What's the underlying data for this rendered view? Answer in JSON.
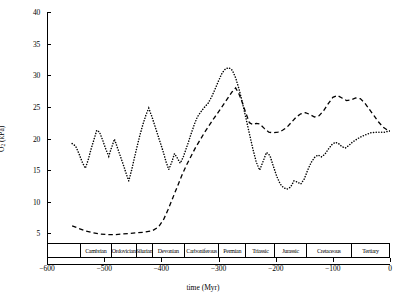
{
  "chart_data": {
    "type": "line",
    "title": "",
    "xlabel": "time (Myr)",
    "ylabel": "O2 (kPa)",
    "ylabel_parts": {
      "base": "O",
      "sub": "2",
      "unit": " (kPa)"
    },
    "xlim": [
      -600,
      0
    ],
    "ylim": [
      0,
      40
    ],
    "xticks": [
      -600,
      -500,
      -400,
      -300,
      -200,
      -100,
      0
    ],
    "xtick_labels": [
      "−600",
      "−500",
      "−400",
      "−300",
      "−200",
      "−100",
      "0"
    ],
    "yticks": [
      5,
      10,
      15,
      20,
      25,
      30,
      35,
      40
    ],
    "ytick_labels": [
      "5",
      "10",
      "15",
      "20",
      "25",
      "30",
      "35",
      "40"
    ],
    "grid": false,
    "legend": "none",
    "series": [
      {
        "name": "dotted-curve",
        "style": "dotted",
        "color": "#000000",
        "points": [
          [
            -556,
            19.2
          ],
          [
            -550,
            18.8
          ],
          [
            -544,
            17.6
          ],
          [
            -538,
            16.2
          ],
          [
            -533,
            15.3
          ],
          [
            -528,
            16.6
          ],
          [
            -523,
            18.3
          ],
          [
            -518,
            19.8
          ],
          [
            -513,
            21.3
          ],
          [
            -508,
            21.0
          ],
          [
            -502,
            19.6
          ],
          [
            -497,
            18.3
          ],
          [
            -492,
            17.2
          ],
          [
            -487,
            18.6
          ],
          [
            -482,
            19.9
          ],
          [
            -477,
            18.6
          ],
          [
            -472,
            17.3
          ],
          [
            -467,
            16.0
          ],
          [
            -462,
            14.6
          ],
          [
            -457,
            13.3
          ],
          [
            -452,
            15.0
          ],
          [
            -447,
            17.0
          ],
          [
            -442,
            18.9
          ],
          [
            -437,
            20.7
          ],
          [
            -432,
            22.3
          ],
          [
            -427,
            23.7
          ],
          [
            -422,
            24.8
          ],
          [
            -417,
            23.6
          ],
          [
            -412,
            22.2
          ],
          [
            -407,
            20.8
          ],
          [
            -402,
            19.4
          ],
          [
            -397,
            18.0
          ],
          [
            -392,
            16.4
          ],
          [
            -387,
            15.1
          ],
          [
            -382,
            16.2
          ],
          [
            -377,
            17.6
          ],
          [
            -372,
            16.9
          ],
          [
            -367,
            16.1
          ],
          [
            -362,
            17.0
          ],
          [
            -357,
            18.3
          ],
          [
            -352,
            19.6
          ],
          [
            -347,
            21.0
          ],
          [
            -342,
            22.3
          ],
          [
            -337,
            23.4
          ],
          [
            -331,
            24.2
          ],
          [
            -325,
            24.9
          ],
          [
            -318,
            25.6
          ],
          [
            -312,
            26.6
          ],
          [
            -306,
            27.8
          ],
          [
            -300,
            29.1
          ],
          [
            -294,
            30.3
          ],
          [
            -288,
            31.0
          ],
          [
            -282,
            31.2
          ],
          [
            -276,
            30.8
          ],
          [
            -270,
            29.6
          ],
          [
            -264,
            27.8
          ],
          [
            -258,
            25.6
          ],
          [
            -252,
            23.2
          ],
          [
            -246,
            20.8
          ],
          [
            -240,
            18.4
          ],
          [
            -234,
            16.3
          ],
          [
            -228,
            15.0
          ],
          [
            -222,
            16.4
          ],
          [
            -216,
            17.8
          ],
          [
            -210,
            17.3
          ],
          [
            -204,
            15.6
          ],
          [
            -198,
            14.0
          ],
          [
            -192,
            12.8
          ],
          [
            -186,
            12.2
          ],
          [
            -180,
            12.0
          ],
          [
            -174,
            12.3
          ],
          [
            -168,
            13.3
          ],
          [
            -162,
            13.1
          ],
          [
            -156,
            12.8
          ],
          [
            -150,
            13.6
          ],
          [
            -144,
            15.0
          ],
          [
            -138,
            16.2
          ],
          [
            -132,
            17.0
          ],
          [
            -126,
            17.4
          ],
          [
            -120,
            17.1
          ],
          [
            -114,
            17.5
          ],
          [
            -108,
            18.3
          ],
          [
            -102,
            19.0
          ],
          [
            -96,
            19.4
          ],
          [
            -90,
            19.2
          ],
          [
            -84,
            18.7
          ],
          [
            -78,
            18.5
          ],
          [
            -72,
            18.9
          ],
          [
            -66,
            19.4
          ],
          [
            -58,
            19.9
          ],
          [
            -50,
            20.3
          ],
          [
            -42,
            20.6
          ],
          [
            -34,
            20.9
          ],
          [
            -26,
            21.0
          ],
          [
            -18,
            21.0
          ],
          [
            -10,
            21.0
          ],
          [
            0,
            21.2
          ]
        ]
      },
      {
        "name": "dashed-curve",
        "style": "dashed",
        "color": "#000000",
        "points": [
          [
            -556,
            6.2
          ],
          [
            -545,
            5.8
          ],
          [
            -533,
            5.4
          ],
          [
            -520,
            5.1
          ],
          [
            -507,
            4.9
          ],
          [
            -494,
            4.8
          ],
          [
            -481,
            4.8
          ],
          [
            -468,
            4.9
          ],
          [
            -455,
            5.0
          ],
          [
            -442,
            5.1
          ],
          [
            -429,
            5.2
          ],
          [
            -416,
            5.4
          ],
          [
            -405,
            6.0
          ],
          [
            -396,
            7.2
          ],
          [
            -388,
            8.8
          ],
          [
            -380,
            10.6
          ],
          [
            -372,
            12.4
          ],
          [
            -364,
            14.2
          ],
          [
            -356,
            15.8
          ],
          [
            -348,
            17.2
          ],
          [
            -340,
            18.6
          ],
          [
            -332,
            19.8
          ],
          [
            -324,
            21.0
          ],
          [
            -316,
            22.1
          ],
          [
            -308,
            23.2
          ],
          [
            -300,
            24.2
          ],
          [
            -294,
            25.0
          ],
          [
            -288,
            25.8
          ],
          [
            -282,
            26.6
          ],
          [
            -276,
            27.4
          ],
          [
            -270,
            28.0
          ],
          [
            -264,
            27.0
          ],
          [
            -258,
            25.6
          ],
          [
            -252,
            24.0
          ],
          [
            -246,
            22.5
          ],
          [
            -240,
            22.2
          ],
          [
            -234,
            22.4
          ],
          [
            -228,
            22.3
          ],
          [
            -220,
            21.6
          ],
          [
            -212,
            21.0
          ],
          [
            -204,
            20.9
          ],
          [
            -196,
            21.0
          ],
          [
            -188,
            21.3
          ],
          [
            -180,
            21.8
          ],
          [
            -172,
            22.6
          ],
          [
            -164,
            23.4
          ],
          [
            -156,
            23.9
          ],
          [
            -148,
            24.1
          ],
          [
            -140,
            23.8
          ],
          [
            -132,
            23.4
          ],
          [
            -124,
            23.6
          ],
          [
            -116,
            24.4
          ],
          [
            -108,
            25.5
          ],
          [
            -100,
            26.5
          ],
          [
            -92,
            26.8
          ],
          [
            -84,
            26.4
          ],
          [
            -76,
            26.0
          ],
          [
            -68,
            26.1
          ],
          [
            -60,
            26.4
          ],
          [
            -52,
            26.3
          ],
          [
            -44,
            25.6
          ],
          [
            -36,
            24.6
          ],
          [
            -28,
            23.6
          ],
          [
            -20,
            22.6
          ],
          [
            -12,
            21.8
          ],
          [
            -4,
            21.3
          ],
          [
            0,
            21.2
          ]
        ]
      }
    ],
    "period_band": {
      "name": "geological-period-band",
      "range": [
        -600,
        0
      ],
      "periods": [
        {
          "label": "",
          "start": -600,
          "end": -542
        },
        {
          "label": "Cambrian",
          "start": -542,
          "end": -488
        },
        {
          "label": "Ordovician",
          "start": -488,
          "end": -444
        },
        {
          "label": "Silurian",
          "start": -444,
          "end": -416
        },
        {
          "label": "Devonian",
          "start": -416,
          "end": -359
        },
        {
          "label": "Carboniferous",
          "start": -359,
          "end": -299
        },
        {
          "label": "Permian",
          "start": -299,
          "end": -251
        },
        {
          "label": "Triassic",
          "start": -251,
          "end": -200
        },
        {
          "label": "Jurassic",
          "start": -200,
          "end": -145
        },
        {
          "label": "Cretaceous",
          "start": -145,
          "end": -65
        },
        {
          "label": "Tertiary",
          "start": -65,
          "end": 0
        }
      ]
    }
  }
}
